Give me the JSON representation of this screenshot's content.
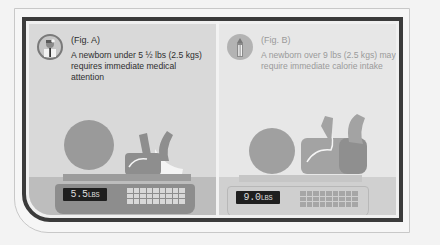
{
  "figures": [
    {
      "label": "(Fig. A)",
      "text": "A newborn under 5 ½ lbs (2.5 kgs) requires immediate medical attention",
      "icon": "doctor-icon",
      "scale_reading": "5.5",
      "scale_unit": "LBS",
      "panel_color": "#d9d9d9",
      "text_color": "#2e2e2e"
    },
    {
      "label": "(Fig. B)",
      "text": "A newborn over 9 lbs (2.5 kgs) may require immediate calorie intake",
      "icon": "baby-bottle-icon",
      "scale_reading": "9.0",
      "scale_unit": "LBS",
      "panel_color": "#e7e7e7",
      "text_color": "#9a9a9a"
    }
  ],
  "colors": {
    "frame_border": "#3b3b3b",
    "page_background": "#f3f3f3"
  }
}
